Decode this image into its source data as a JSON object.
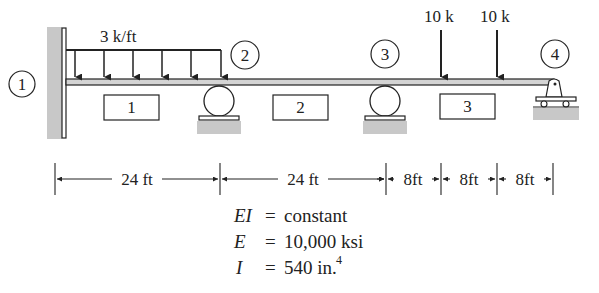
{
  "diagram": {
    "distributed_load": {
      "label": "3 k/ft",
      "value": 3,
      "unit": "k/ft",
      "span_ft": 24
    },
    "point_loads": [
      {
        "label": "10 k",
        "value": 10,
        "unit": "k"
      },
      {
        "label": "10 k",
        "value": 10,
        "unit": "k"
      }
    ],
    "nodes": [
      {
        "id": "1",
        "support": "fixed"
      },
      {
        "id": "2",
        "support": "roller"
      },
      {
        "id": "3",
        "support": "roller"
      },
      {
        "id": "4",
        "support": "pinned-roller"
      }
    ],
    "elements": [
      {
        "id": "1"
      },
      {
        "id": "2"
      },
      {
        "id": "3"
      }
    ],
    "dimensions": [
      {
        "label": "24 ft",
        "value": 24
      },
      {
        "label": "24 ft",
        "value": 24
      },
      {
        "label": "8ft",
        "value": 8
      },
      {
        "label": "8ft",
        "value": 8
      },
      {
        "label": "8ft",
        "value": 8
      }
    ],
    "properties": {
      "EI": {
        "symbol": "EI",
        "eq": "=",
        "value": "constant"
      },
      "E": {
        "symbol": "E",
        "eq": "=",
        "value": "10,000 ksi"
      },
      "I": {
        "symbol": "I",
        "eq": "=",
        "value": "540 in.",
        "sup": "4"
      }
    },
    "colors": {
      "ink": "#222222",
      "ground": "#c8c8c8",
      "beam_fill": "#d4d4d4"
    }
  }
}
